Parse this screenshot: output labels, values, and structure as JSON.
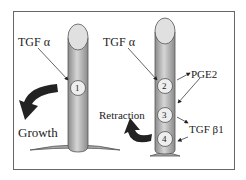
{
  "diagram": {
    "left_cell": {
      "label_top": "TGF α",
      "node": "1",
      "arrow_label": "Growth"
    },
    "right_cell": {
      "label_top": "TGF α",
      "nodes": [
        "2",
        "3",
        "4"
      ],
      "label_pge2": "PGE2",
      "label_tgfb1": "TGF β1",
      "arrow_label": "Retraction"
    },
    "colors": {
      "pillar": "#bdbdbd",
      "pillar_dark": "#8a8a8a",
      "tip": "#e0e0e0",
      "arrow": "#222222",
      "frame": "#666666"
    }
  }
}
